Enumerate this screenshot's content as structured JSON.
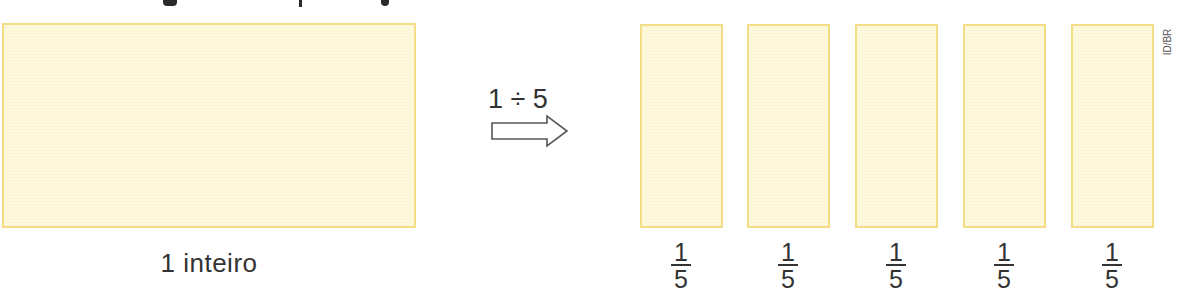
{
  "whole": {
    "label": "1 inteiro",
    "fill_color": "#fef9dc",
    "border_color": "#f3dd86"
  },
  "operation": {
    "expression": "1 ÷ 5",
    "arrow_icon": "hollow-right-arrow"
  },
  "parts": [
    {
      "numerator": "1",
      "denominator": "5"
    },
    {
      "numerator": "1",
      "denominator": "5"
    },
    {
      "numerator": "1",
      "denominator": "5"
    },
    {
      "numerator": "1",
      "denominator": "5"
    },
    {
      "numerator": "1",
      "denominator": "5"
    }
  ],
  "credit": "ID/BR"
}
